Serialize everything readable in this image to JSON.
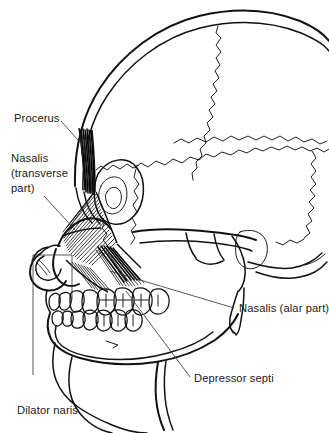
{
  "figure": {
    "kind": "anatomical-line-illustration",
    "view": "lateral (side) view of human skull",
    "background_color": "#ffffff",
    "line_color": "#111111",
    "leader_color": "#3a3a3a",
    "text_color": "#1a1a1a",
    "width": 329,
    "height": 433
  },
  "labels": {
    "procerus": "Procerus",
    "nasalis_transverse_line1": "Nasalis",
    "nasalis_transverse_line2": "(transverse",
    "nasalis_transverse_line3": "part)",
    "nasalis_alar": "Nasalis (alar part)",
    "depressor_septi": "Depressor septi",
    "dilator_naris": "Dilator naris"
  },
  "structures": [
    {
      "name": "procerus",
      "label": "Procerus",
      "type": "muscle"
    },
    {
      "name": "nasalis-transverse-part",
      "label": "Nasalis (transverse part)",
      "type": "muscle"
    },
    {
      "name": "nasalis-alar-part",
      "label": "Nasalis (alar part)",
      "type": "muscle"
    },
    {
      "name": "depressor-septi",
      "label": "Depressor septi",
      "type": "muscle"
    },
    {
      "name": "dilator-naris",
      "label": "Dilator naris",
      "type": "muscle"
    },
    {
      "name": "cranial-vault",
      "label": "Cranial vault",
      "type": "bone"
    },
    {
      "name": "coronal-suture",
      "label": "Coronal suture",
      "type": "suture"
    },
    {
      "name": "orbit",
      "label": "Orbit",
      "type": "bone"
    },
    {
      "name": "zygomatic-arch",
      "label": "Zygomatic arch",
      "type": "bone"
    },
    {
      "name": "mandible",
      "label": "Mandible",
      "type": "bone"
    },
    {
      "name": "maxillary-teeth",
      "label": "Maxillary teeth",
      "type": "teeth"
    },
    {
      "name": "mandibular-teeth",
      "label": "Mandibular teeth",
      "type": "teeth"
    }
  ]
}
